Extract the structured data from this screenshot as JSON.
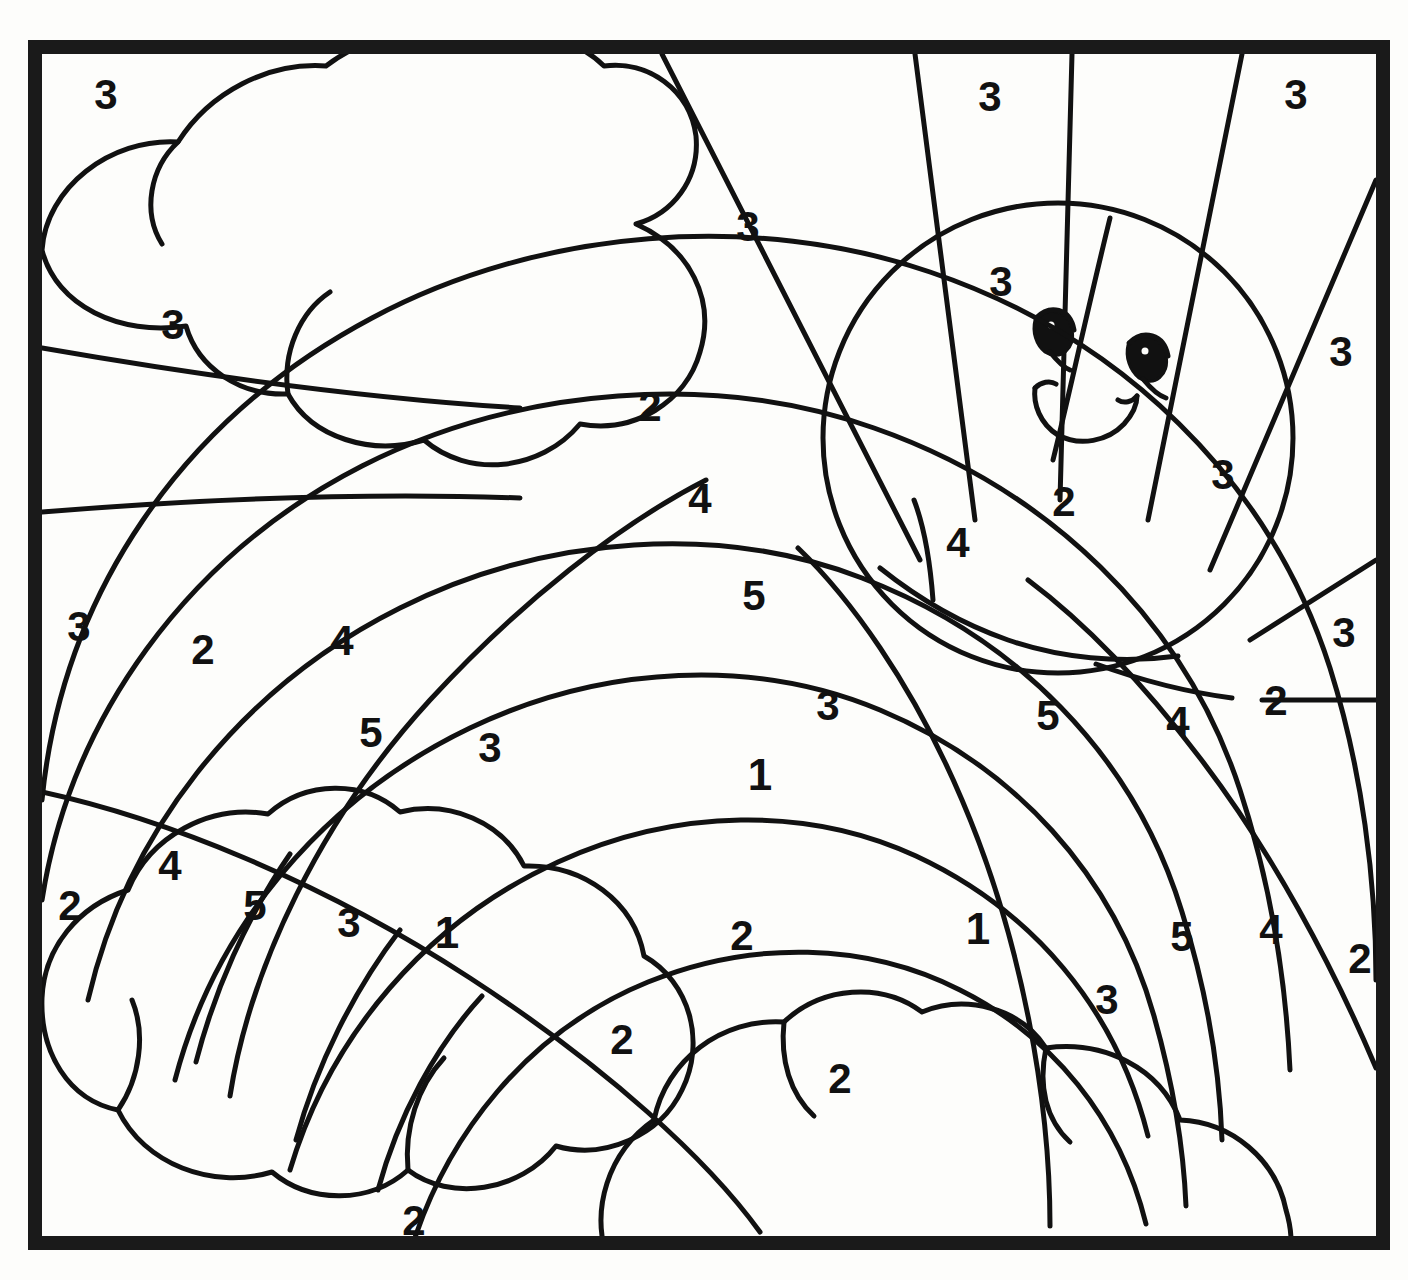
{
  "page": {
    "kind": "coloring-page",
    "width": 1408,
    "height": 1280,
    "background_color": "#fdfdfb",
    "ink_color": "#111111",
    "border": {
      "color": "#1a1a1a",
      "thickness_px": 14,
      "inset_left": 28,
      "inset_top": 40,
      "inset_right": 20,
      "inset_bottom": 30
    }
  },
  "scene": {
    "elements": [
      "large-cloud-top-left",
      "smiling-sun-top-right",
      "sun-rays",
      "rainbow-arc-bands",
      "cloud-bottom-left",
      "cloud-bottom-right"
    ]
  },
  "legend": {
    "numbers_used": [
      "1",
      "2",
      "3",
      "4",
      "5"
    ],
    "count_total": 38
  },
  "numbers": [
    {
      "id": "n01",
      "value": "3",
      "x": 106,
      "y": 95,
      "region": "sky-upper-left"
    },
    {
      "id": "n02",
      "value": "3",
      "x": 748,
      "y": 227,
      "region": "sky-between-cloud-and-rays"
    },
    {
      "id": "n03",
      "value": "3",
      "x": 990,
      "y": 97,
      "region": "sun-ray-gap-upper-left"
    },
    {
      "id": "n04",
      "value": "3",
      "x": 1296,
      "y": 95,
      "region": "sun-ray-gap-upper-right"
    },
    {
      "id": "n05",
      "value": "3",
      "x": 173,
      "y": 325,
      "region": "sky-left-below-cloud"
    },
    {
      "id": "n06",
      "value": "3",
      "x": 1001,
      "y": 282,
      "region": "sun-face-upper-left"
    },
    {
      "id": "n07",
      "value": "3",
      "x": 1341,
      "y": 352,
      "region": "sun-ray-gap-right"
    },
    {
      "id": "n08",
      "value": "2",
      "x": 650,
      "y": 407,
      "region": "rainbow-band-outer-top"
    },
    {
      "id": "n09",
      "value": "4",
      "x": 700,
      "y": 499,
      "region": "rainbow-band-2-top"
    },
    {
      "id": "n10",
      "value": "4",
      "x": 958,
      "y": 543,
      "region": "rainbow-band-2-right-of-sun"
    },
    {
      "id": "n11",
      "value": "2",
      "x": 1064,
      "y": 502,
      "region": "rainbow-band-outer-over-sun"
    },
    {
      "id": "n12",
      "value": "3",
      "x": 1223,
      "y": 475,
      "region": "sun-face-lower-right"
    },
    {
      "id": "n13",
      "value": "5",
      "x": 754,
      "y": 596,
      "region": "rainbow-band-3-top"
    },
    {
      "id": "n14",
      "value": "3",
      "x": 79,
      "y": 627,
      "region": "sky-far-left-mid"
    },
    {
      "id": "n15",
      "value": "2",
      "x": 203,
      "y": 650,
      "region": "rainbow-band-outer-left"
    },
    {
      "id": "n16",
      "value": "4",
      "x": 342,
      "y": 641,
      "region": "rainbow-band-2-left"
    },
    {
      "id": "n17",
      "value": "3",
      "x": 1344,
      "y": 633,
      "region": "sky-far-right-mid"
    },
    {
      "id": "n18",
      "value": "3",
      "x": 828,
      "y": 706,
      "region": "rainbow-band-4-upper-right"
    },
    {
      "id": "n19",
      "value": "5",
      "x": 1048,
      "y": 716,
      "region": "rainbow-band-3-right"
    },
    {
      "id": "n20",
      "value": "4",
      "x": 1178,
      "y": 722,
      "region": "rainbow-band-2-right"
    },
    {
      "id": "n21",
      "value": "2",
      "x": 1276,
      "y": 701,
      "region": "rainbow-band-outer-right"
    },
    {
      "id": "n22",
      "value": "5",
      "x": 371,
      "y": 733,
      "region": "rainbow-band-3-left"
    },
    {
      "id": "n23",
      "value": "3",
      "x": 490,
      "y": 748,
      "region": "rainbow-band-4-left"
    },
    {
      "id": "n24",
      "value": "1",
      "x": 760,
      "y": 775,
      "region": "rainbow-band-5-top-inner"
    },
    {
      "id": "n25",
      "value": "2",
      "x": 70,
      "y": 906,
      "region": "sky-lower-left-corner"
    },
    {
      "id": "n26",
      "value": "4",
      "x": 170,
      "y": 866,
      "region": "rainbow-band-2-lower-left"
    },
    {
      "id": "n27",
      "value": "5",
      "x": 255,
      "y": 906,
      "region": "rainbow-band-3-lower-left"
    },
    {
      "id": "n28",
      "value": "3",
      "x": 349,
      "y": 923,
      "region": "rainbow-band-4-lower-left"
    },
    {
      "id": "n29",
      "value": "1",
      "x": 447,
      "y": 933,
      "region": "rainbow-band-5-lower-left"
    },
    {
      "id": "n30",
      "value": "2",
      "x": 742,
      "y": 936,
      "region": "rainbow-inner-center"
    },
    {
      "id": "n31",
      "value": "1",
      "x": 978,
      "y": 929,
      "region": "rainbow-band-5-lower-right"
    },
    {
      "id": "n32",
      "value": "5",
      "x": 1182,
      "y": 937,
      "region": "rainbow-band-3-lower-right"
    },
    {
      "id": "n33",
      "value": "4",
      "x": 1271,
      "y": 930,
      "region": "rainbow-band-2-lower-right"
    },
    {
      "id": "n34",
      "value": "2",
      "x": 1360,
      "y": 959,
      "region": "sky-lower-right-corner"
    },
    {
      "id": "n35",
      "value": "3",
      "x": 1107,
      "y": 1000,
      "region": "rainbow-band-4-lower-right"
    },
    {
      "id": "n36",
      "value": "2",
      "x": 622,
      "y": 1040,
      "region": "rainbow-inner-lower-left"
    },
    {
      "id": "n37",
      "value": "2",
      "x": 840,
      "y": 1079,
      "region": "rainbow-inner-lower-center"
    },
    {
      "id": "n38",
      "value": "2",
      "x": 414,
      "y": 1221,
      "region": "sky-bottom-below-cloud"
    }
  ]
}
